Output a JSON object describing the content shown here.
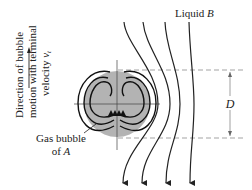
{
  "labels": {
    "liquid": "Liquid ",
    "liquid_var": "B",
    "direction_line1": "Direction of bubble",
    "direction_line2": "motion with terminal",
    "direction_line3": "velocity ",
    "direction_var": "v",
    "direction_sub": "t",
    "gas_line1": "Gas bubble",
    "gas_line2": "of ",
    "gas_var": "A",
    "dimension": "D"
  },
  "colors": {
    "bubble_fill": "#b3b3b3",
    "line": "#222222",
    "dash": "#999999"
  }
}
